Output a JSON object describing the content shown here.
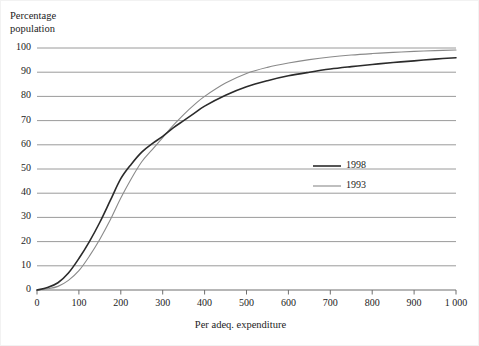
{
  "chart_data": {
    "type": "line",
    "title": "",
    "xlabel": "Per adeq. expenditure",
    "ylabel": "Percentage population",
    "ylabel_line1": "Percentage",
    "ylabel_line2": "population",
    "xlim": [
      0,
      1000
    ],
    "ylim": [
      0,
      100
    ],
    "grid": "horizontal",
    "legend_position": "center-right",
    "x_ticks": [
      0,
      100,
      200,
      300,
      400,
      500,
      600,
      700,
      800,
      900,
      1000
    ],
    "x_tick_labels": [
      "0",
      "100",
      "200",
      "300",
      "400",
      "500",
      "600",
      "700",
      "800",
      "900",
      "1 000"
    ],
    "y_ticks": [
      0,
      10,
      20,
      30,
      40,
      50,
      60,
      70,
      80,
      90,
      100
    ],
    "y_tick_labels": [
      "0",
      "10",
      "20",
      "30",
      "40",
      "50",
      "60",
      "70",
      "80",
      "90",
      "100"
    ],
    "x": [
      0,
      25,
      50,
      75,
      100,
      125,
      150,
      175,
      200,
      225,
      250,
      275,
      300,
      325,
      350,
      375,
      400,
      450,
      500,
      550,
      600,
      650,
      700,
      750,
      800,
      850,
      900,
      950,
      1000
    ],
    "series": [
      {
        "name": "1998",
        "color": "#2b2b2b",
        "width": 1.6,
        "values": [
          0,
          1,
          3,
          7,
          13,
          20,
          28,
          37,
          46,
          52,
          57,
          60.5,
          63.5,
          67,
          70,
          73,
          76,
          80.5,
          84,
          86.5,
          88.5,
          90,
          91.3,
          92.3,
          93.2,
          94,
          94.7,
          95.4,
          96
        ]
      },
      {
        "name": "1993",
        "color": "#8a8a8a",
        "width": 1.1,
        "values": [
          0,
          0.5,
          1.5,
          4,
          8,
          14,
          21,
          29,
          38,
          46,
          53,
          58,
          63,
          68,
          72.5,
          76.5,
          80,
          85.5,
          89.5,
          92,
          93.8,
          95.2,
          96.3,
          97.1,
          97.7,
          98.2,
          98.6,
          98.9,
          99.2
        ]
      }
    ]
  },
  "legend": {
    "items": [
      {
        "label": "1998"
      },
      {
        "label": "1993"
      }
    ]
  }
}
